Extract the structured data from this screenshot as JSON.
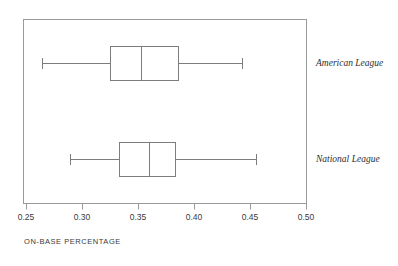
{
  "chart_data": {
    "type": "box",
    "orientation": "horizontal",
    "title": "",
    "xlabel": "ON-BASE PERCENTAGE",
    "ylabel": "",
    "xlim": [
      0.25,
      0.5
    ],
    "xticks": [
      0.25,
      0.3,
      0.35,
      0.4,
      0.45,
      0.5
    ],
    "xticklabels": [
      "0.25",
      "0.30",
      "0.35",
      "0.40",
      "0.45",
      "0.50"
    ],
    "grid": false,
    "legend": "none",
    "categories": [
      "American League",
      "National League"
    ],
    "boxes": [
      {
        "label": "American League",
        "min": 0.264,
        "q1": 0.325,
        "median": 0.353,
        "q3": 0.386,
        "max": 0.443
      },
      {
        "label": "National League",
        "min": 0.289,
        "q1": 0.333,
        "median": 0.36,
        "q3": 0.383,
        "max": 0.455
      }
    ]
  },
  "axis": {
    "tick_0": "0.25",
    "tick_1": "0.30",
    "tick_2": "0.35",
    "tick_3": "0.40",
    "tick_4": "0.45",
    "tick_5": "0.50",
    "title": "ON-BASE PERCENTAGE"
  },
  "labels": {
    "american_league": "American League",
    "national_league": "National League"
  },
  "colors": {
    "frame": "#9a9a9a",
    "box_stroke": "#7d7d7d",
    "text": "#3a3a3a",
    "background": "#ffffff"
  }
}
